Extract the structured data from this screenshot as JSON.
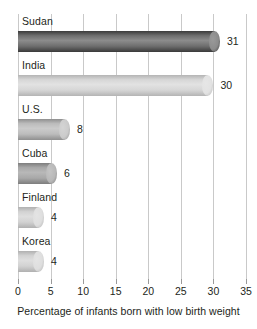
{
  "chart_data": {
    "type": "bar",
    "orientation": "horizontal",
    "title": "",
    "xlabel": "Percentage of infants born with low birth weight",
    "ylabel": "",
    "xlim": [
      0,
      35
    ],
    "xticks": [
      0,
      5,
      10,
      15,
      20,
      25,
      30,
      35
    ],
    "xtick_labels": [
      "0",
      "5",
      "10",
      "15",
      "20",
      "25",
      "30",
      "35"
    ],
    "grid": true,
    "legend": false,
    "categories": [
      "Sudan",
      "India",
      "U.S.",
      "Cuba",
      "Finland",
      "Korea"
    ],
    "values": [
      31,
      30,
      8,
      6,
      4,
      4
    ],
    "value_labels": [
      "31",
      "30",
      "8",
      "6",
      "4",
      "4"
    ],
    "bars": [
      {
        "category": "Sudan",
        "value": 31,
        "label": "31",
        "shade_dark": "#3a3a3a",
        "shade_mid": "#6e6e6e",
        "shade_light": "#8c8c8c",
        "cap": "#9a9a9a"
      },
      {
        "category": "India",
        "value": 30,
        "label": "30",
        "shade_dark": "#b4b4b4",
        "shade_mid": "#d6d6d6",
        "shade_light": "#e2e2e2",
        "cap": "#e6e6e6"
      },
      {
        "category": "U.S.",
        "value": 8,
        "label": "8",
        "shade_dark": "#8f8f8f",
        "shade_mid": "#bcbcbc",
        "shade_light": "#cbcbcb",
        "cap": "#d4d4d4"
      },
      {
        "category": "Cuba",
        "value": 6,
        "label": "6",
        "shade_dark": "#7d7d7d",
        "shade_mid": "#a8a8a8",
        "shade_light": "#b8b8b8",
        "cap": "#c4c4c4"
      },
      {
        "category": "Finland",
        "value": 4,
        "label": "4",
        "shade_dark": "#b0b0b0",
        "shade_mid": "#d2d2d2",
        "shade_light": "#dedede",
        "cap": "#e4e4e4"
      },
      {
        "category": "Korea",
        "value": 4,
        "label": "4",
        "shade_dark": "#b0b0b0",
        "shade_mid": "#d2d2d2",
        "shade_light": "#dedede",
        "cap": "#e4e4e4"
      }
    ],
    "colors": {
      "gridline": "#c9c9c9",
      "tick": "#9a9a9a",
      "text": "#231f20",
      "background": "#ffffff"
    }
  }
}
